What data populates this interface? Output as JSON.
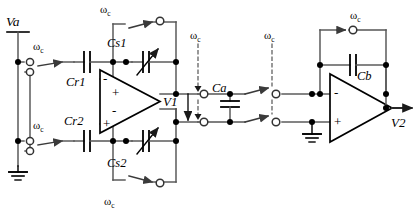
{
  "figure": {
    "type": "circuit-diagram",
    "width": 419,
    "height": 220,
    "background_color": "#ffffff",
    "line_color": "#4a4a4a",
    "text_color": "#000000"
  },
  "labels": {
    "input_node": "Va",
    "intermediate_node": "V1",
    "output_node": "V2",
    "clock": "ω",
    "clock_sub": "c"
  },
  "components": [
    {
      "id": "Cr1",
      "label": "Cr1",
      "kind": "capacitor",
      "variable": false
    },
    {
      "id": "Cr2",
      "label": "Cr2",
      "kind": "capacitor",
      "variable": false
    },
    {
      "id": "Cs1",
      "label": "Cs1",
      "kind": "capacitor",
      "variable": true
    },
    {
      "id": "Cs2",
      "label": "Cs2",
      "kind": "capacitor",
      "variable": true
    },
    {
      "id": "Ca",
      "label": "Ca",
      "kind": "capacitor",
      "variable": false
    },
    {
      "id": "Cb",
      "label": "Cb",
      "kind": "capacitor",
      "variable": false
    }
  ],
  "amplifiers": [
    {
      "id": "opamp-differential",
      "terminals": [
        "-",
        "+",
        "+",
        "-"
      ]
    },
    {
      "id": "opamp-output",
      "terminals": [
        "-",
        "+"
      ]
    }
  ],
  "switches": [
    {
      "id": "sw-cs1-top",
      "clock_label": "ω",
      "clock_sub": "c"
    },
    {
      "id": "sw-input-top",
      "clock_label": "ω",
      "clock_sub": "c"
    },
    {
      "id": "sw-input-bottom",
      "clock_label": "ω",
      "clock_sub": "c"
    },
    {
      "id": "sw-cs2-bottom",
      "clock_label": "ω",
      "clock_sub": "c"
    },
    {
      "id": "sw-ca-left",
      "clock_label": "ω",
      "clock_sub": "c"
    },
    {
      "id": "sw-ca-right",
      "clock_label": "ω",
      "clock_sub": "c"
    },
    {
      "id": "sw-cb-feedback",
      "clock_label": "ω",
      "clock_sub": "c"
    }
  ],
  "grounds": [
    {
      "id": "ground-input"
    },
    {
      "id": "ground-output-amp"
    }
  ]
}
